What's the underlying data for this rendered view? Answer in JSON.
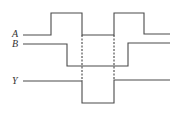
{
  "diagram": {
    "type": "timing-diagram",
    "signals": [
      {
        "name": "A",
        "label": "A",
        "levels": [
          "low",
          "high",
          "low",
          "high",
          "low"
        ]
      },
      {
        "name": "B",
        "label": "B",
        "levels": [
          "high",
          "low",
          "high"
        ]
      },
      {
        "name": "Y",
        "label": "Y",
        "levels": [
          "high",
          "low",
          "high"
        ]
      }
    ],
    "dashed_markers": 2,
    "line_color": "#4a4a4a"
  }
}
